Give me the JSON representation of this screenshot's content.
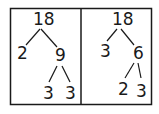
{
  "diagram": {
    "type": "factor-trees",
    "stroke_color": "#1a1a1a",
    "trees": [
      {
        "root": "18",
        "children": [
          {
            "value": "2"
          },
          {
            "value": "9",
            "children": [
              {
                "value": "3"
              },
              {
                "value": "3"
              }
            ]
          }
        ]
      },
      {
        "root": "18",
        "children": [
          {
            "value": "3"
          },
          {
            "value": "6",
            "children": [
              {
                "value": "2"
              },
              {
                "value": "3"
              }
            ]
          }
        ]
      }
    ]
  }
}
